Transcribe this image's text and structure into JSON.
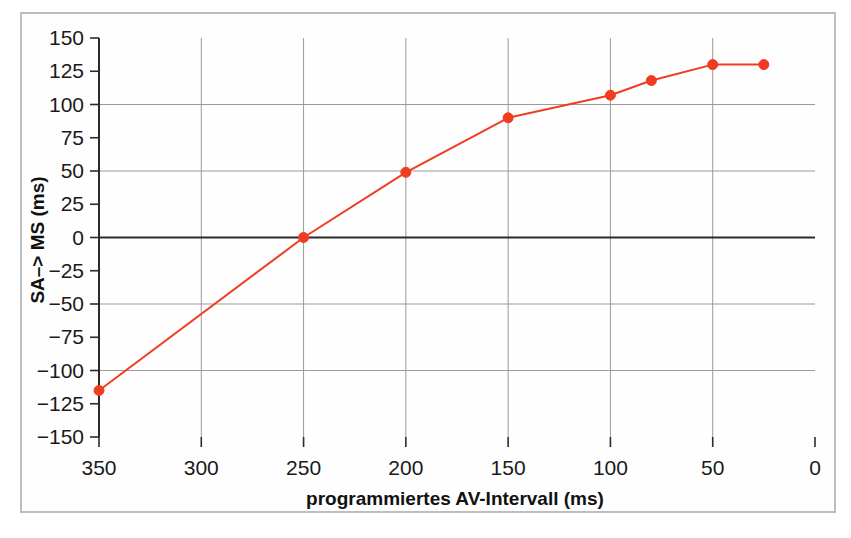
{
  "figure": {
    "frame_color": "#bdbdbd",
    "background": "#ffffff"
  },
  "chart_data": {
    "type": "line",
    "title": "",
    "subtitle": "",
    "xlabel": "programmiertes AV-Intervall (ms)",
    "ylabel": "SA–> MS (ms)",
    "xlim": [
      350,
      0
    ],
    "ylim": [
      -150,
      150
    ],
    "x_inverted": true,
    "grid": true,
    "grid_axis": "both",
    "legend": null,
    "legend_position": "none",
    "series_color": "#f03c20",
    "marker": "circle",
    "marker_size": 9,
    "x_ticks": [
      350,
      300,
      250,
      200,
      150,
      100,
      50,
      0
    ],
    "x_tick_labels": [
      "350",
      "300",
      "250",
      "200",
      "150",
      "100",
      "50",
      "0"
    ],
    "y_ticks": [
      150,
      125,
      100,
      75,
      50,
      25,
      0,
      -25,
      -50,
      -75,
      -100,
      -125,
      -150
    ],
    "y_tick_labels": [
      "150",
      "125",
      "100",
      "75",
      "50",
      "25",
      "0",
      "−25",
      "−50",
      "−75",
      "−100",
      "−125",
      "−150"
    ],
    "y_major_gridlines": [
      100,
      50,
      0,
      -50,
      -100
    ],
    "x_major_gridlines": [
      300,
      250,
      200,
      150,
      100,
      50
    ],
    "zero_line": 0,
    "series": [
      {
        "name": "SA->MS",
        "x": [
          350,
          250,
          200,
          150,
          100,
          80,
          50,
          25
        ],
        "values": [
          -115,
          0,
          49,
          90,
          107,
          118,
          130,
          130
        ]
      }
    ]
  }
}
